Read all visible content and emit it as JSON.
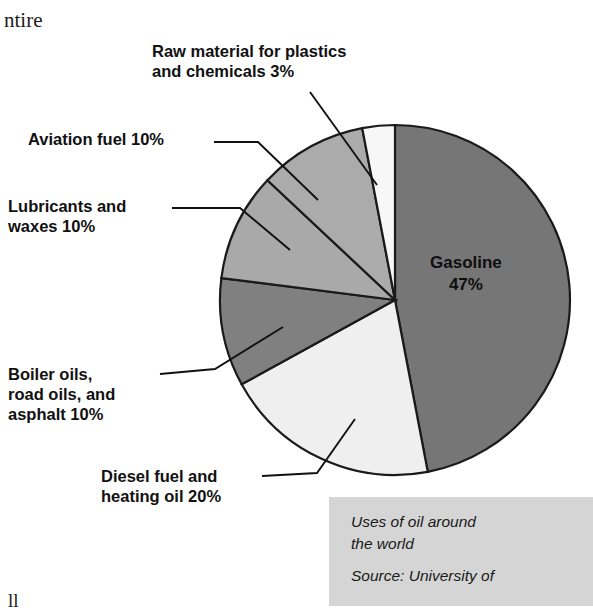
{
  "page_fragments": {
    "top_left_text": "ntire",
    "bottom_left_text": "ll"
  },
  "colors": {
    "gasoline": "#767676",
    "diesel": "#efefef",
    "boiler_oils": "#808080",
    "lubricants": "#a9a9a9",
    "aviation": "#ababab",
    "raw_material": "#f7f7f7",
    "outline": "#1a1a1a",
    "caption_background": "#d5d5d5",
    "text": "#111111",
    "page_background": "#ffffff"
  },
  "labels": {
    "raw_material": "Raw material for plastics\nand chemicals 3%",
    "aviation": "Aviation fuel 10%",
    "lubricants": "Lubricants and\nwaxes 10%",
    "boiler": "Boiler oils,\nroad oils, and\nasphalt 10%",
    "diesel": "Diesel fuel and\nheating oil 20%",
    "gasoline": "Gasoline\n47%"
  },
  "caption": {
    "title": "Uses of oil around\nthe world",
    "source": "Source: University of"
  },
  "chart_data": {
    "type": "pie",
    "title": "Uses of oil around the world",
    "subtitle": "Source: University of",
    "units": "percent",
    "total": 100,
    "start_angle_deg": 0,
    "direction": "clockwise",
    "grid": false,
    "legend": "none (direct labels with leader lines)",
    "center": {
      "x": 395,
      "y": 300
    },
    "radius": 175,
    "slices": [
      {
        "label": "Gasoline",
        "value": 47,
        "value_text": "47%",
        "color": "#767676",
        "start_deg": 0,
        "end_deg": 169.2,
        "label_placement": "inside"
      },
      {
        "label": "Diesel fuel and heating oil",
        "value": 20,
        "value_text": "20%",
        "color": "#efefef",
        "start_deg": 169.2,
        "end_deg": 241.2,
        "label_placement": "leader-line-bottom-left"
      },
      {
        "label": "Boiler oils, road oils, and asphalt",
        "value": 10,
        "value_text": "10%",
        "color": "#808080",
        "start_deg": 241.2,
        "end_deg": 277.2,
        "label_placement": "leader-line-left"
      },
      {
        "label": "Lubricants and waxes",
        "value": 10,
        "value_text": "10%",
        "color": "#a9a9a9",
        "start_deg": 277.2,
        "end_deg": 313.2,
        "label_placement": "leader-line-left"
      },
      {
        "label": "Aviation fuel",
        "value": 10,
        "value_text": "10%",
        "color": "#ababab",
        "start_deg": 313.2,
        "end_deg": 349.2,
        "label_placement": "leader-line-upper-left"
      },
      {
        "label": "Raw material for plastics and chemicals",
        "value": 3,
        "value_text": "3%",
        "color": "#f7f7f7",
        "start_deg": 349.2,
        "end_deg": 360,
        "label_placement": "leader-line-top"
      }
    ]
  }
}
